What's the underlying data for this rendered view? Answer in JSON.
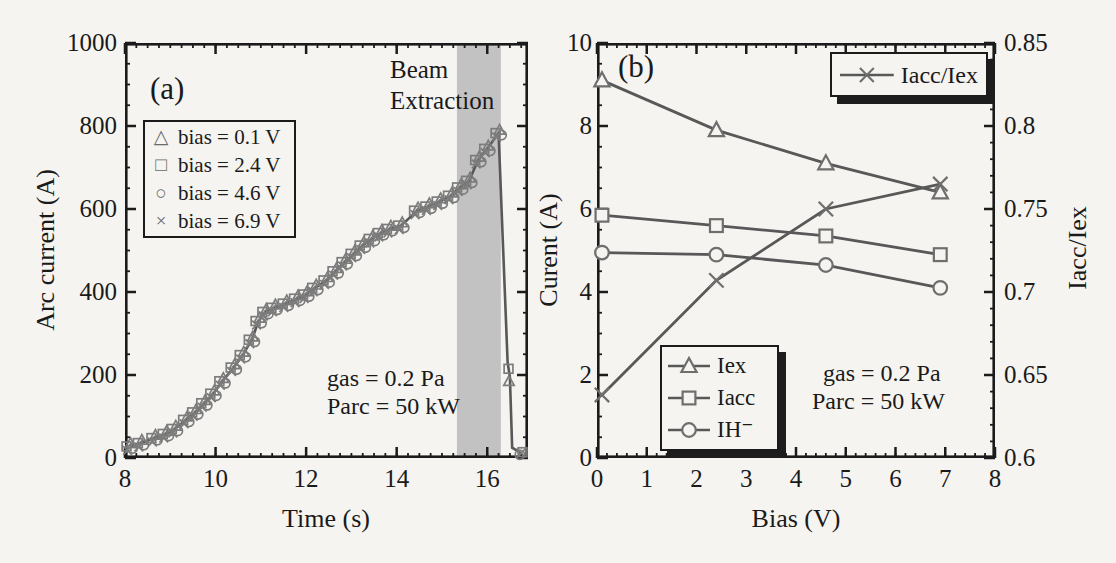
{
  "figure": {
    "background": "#f5f4f0",
    "frame_color": "#1b1b1b",
    "band_color": "#c2c2c2",
    "line_color": "#585858",
    "marker_color": "#7c7c7c",
    "marker_fill": "#f5f4f0"
  },
  "chart_data": [
    {
      "id": "a",
      "type": "line",
      "panel_label": "(a)",
      "xlabel": "Time (s)",
      "ylabel": "Arc current (A)",
      "xlim": [
        8,
        16.9
      ],
      "ylim": [
        0,
        1000
      ],
      "xticks": [
        8,
        10,
        12,
        14,
        16
      ],
      "yticks": [
        0,
        200,
        400,
        600,
        800,
        1000
      ],
      "x_minor_step": 0.25,
      "y_minor_step": 50,
      "grid": false,
      "band": {
        "x0": 15.33,
        "x1": 16.3,
        "label_line1": "Beam",
        "label_line2": "Extraction"
      },
      "conditions": [
        "gas = 0.2 Pa",
        "Parc = 50 kW"
      ],
      "legend": {
        "items": [
          {
            "marker": "triangle",
            "label": "bias = 0.1 V"
          },
          {
            "marker": "square",
            "label": "bias = 2.4 V"
          },
          {
            "marker": "circle",
            "label": "bias = 4.6 V"
          },
          {
            "marker": "x",
            "label": "bias = 6.9 V"
          }
        ]
      },
      "curve": [
        [
          8.1,
          28
        ],
        [
          8.35,
          36
        ],
        [
          8.65,
          48
        ],
        [
          8.9,
          58
        ],
        [
          9.1,
          70
        ],
        [
          9.35,
          92
        ],
        [
          9.55,
          110
        ],
        [
          9.75,
          132
        ],
        [
          9.95,
          155
        ],
        [
          10.15,
          185
        ],
        [
          10.4,
          218
        ],
        [
          10.6,
          248
        ],
        [
          10.8,
          285
        ],
        [
          10.95,
          330
        ],
        [
          11.1,
          352
        ],
        [
          11.3,
          362
        ],
        [
          11.55,
          372
        ],
        [
          11.8,
          384
        ],
        [
          12.0,
          394
        ],
        [
          12.2,
          410
        ],
        [
          12.45,
          428
        ],
        [
          12.65,
          450
        ],
        [
          12.85,
          472
        ],
        [
          13.05,
          492
        ],
        [
          13.25,
          512
        ],
        [
          13.45,
          528
        ],
        [
          13.65,
          542
        ],
        [
          13.85,
          552
        ],
        [
          14.1,
          560
        ],
        [
          14.45,
          596
        ],
        [
          14.7,
          606
        ],
        [
          14.95,
          618
        ],
        [
          15.2,
          632
        ],
        [
          15.4,
          652
        ],
        [
          15.6,
          668
        ],
        [
          15.8,
          718
        ],
        [
          16.0,
          745
        ],
        [
          16.25,
          783
        ],
        [
          16.45,
          230
        ],
        [
          16.5,
          195
        ],
        [
          16.55,
          25
        ],
        [
          16.75,
          12
        ]
      ],
      "markers_until": 16.3,
      "marker_series": [
        {
          "label": "bias = 0.1 V",
          "marker": "triangle",
          "offset": [
            1,
            -3
          ]
        },
        {
          "label": "bias = 2.4 V",
          "marker": "square",
          "offset": [
            -3,
            0
          ]
        },
        {
          "label": "bias = 4.6 V",
          "marker": "circle",
          "offset": [
            3,
            2
          ]
        },
        {
          "label": "bias = 6.9 V",
          "marker": "x",
          "offset": [
            -2,
            4
          ]
        }
      ],
      "extra_markers": [
        [
          "square",
          16.47,
          215
        ],
        [
          "triangle",
          16.48,
          185
        ],
        [
          "circle",
          16.72,
          8
        ],
        [
          "x",
          16.75,
          12
        ],
        [
          "square",
          16.78,
          14
        ]
      ],
      "layout": {
        "left": 125,
        "top": 43,
        "width": 403,
        "height": 415
      }
    },
    {
      "id": "b",
      "type": "line",
      "panel_label": "(b)",
      "xlabel": "Bias (V)",
      "ylabel": "Curent (A)",
      "ylabel_right": "Iacc/Iex",
      "xlim": [
        0,
        8
      ],
      "ylim": [
        0,
        10
      ],
      "ylim_right": [
        0.6,
        0.85
      ],
      "xticks": [
        0,
        1,
        2,
        3,
        4,
        5,
        6,
        7,
        8
      ],
      "yticks": [
        0,
        2,
        4,
        6,
        8,
        10
      ],
      "yticks_right": [
        0.6,
        0.65,
        0.7,
        0.75,
        0.8,
        0.85
      ],
      "x_minor_step": 0.2,
      "y_minor_step": 0.5,
      "y_minor_step_right": 0.01,
      "grid": false,
      "conditions": [
        "gas = 0.2 Pa",
        "Parc = 50 kW"
      ],
      "legend_top": {
        "items": [
          {
            "marker": "x",
            "label": "Iacc/Iex"
          }
        ]
      },
      "legend_bottom": {
        "items": [
          {
            "marker": "triangle",
            "label": "Iex"
          },
          {
            "marker": "square",
            "label": "Iacc"
          },
          {
            "marker": "circle",
            "label": "IH⁻"
          }
        ]
      },
      "series": [
        {
          "name": "Iex",
          "axis": "left",
          "marker": "triangle",
          "points": [
            [
              0.1,
              9.1
            ],
            [
              2.4,
              7.9
            ],
            [
              4.6,
              7.1
            ],
            [
              6.9,
              6.4
            ]
          ]
        },
        {
          "name": "Iacc",
          "axis": "left",
          "marker": "square",
          "points": [
            [
              0.1,
              5.85
            ],
            [
              2.4,
              5.6
            ],
            [
              4.6,
              5.35
            ],
            [
              6.9,
              4.9
            ]
          ]
        },
        {
          "name": "IH⁻",
          "axis": "left",
          "marker": "circle",
          "points": [
            [
              0.1,
              4.95
            ],
            [
              2.4,
              4.9
            ],
            [
              4.6,
              4.65
            ],
            [
              6.9,
              4.1
            ]
          ]
        },
        {
          "name": "Iacc/Iex",
          "axis": "right",
          "marker": "x",
          "points": [
            [
              0.1,
              0.638
            ],
            [
              2.4,
              0.707
            ],
            [
              4.6,
              0.75
            ],
            [
              6.9,
              0.765
            ]
          ]
        }
      ],
      "layout": {
        "left": 597,
        "top": 43,
        "width": 398,
        "height": 415
      }
    }
  ]
}
